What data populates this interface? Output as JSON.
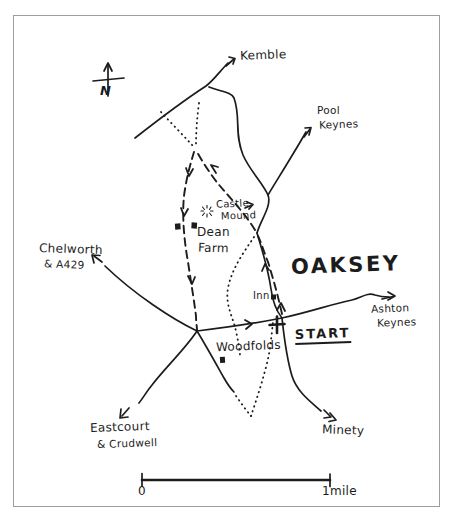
{
  "colors": {
    "ink": "#1c1c1c",
    "frame": "#9e9e9e",
    "paper": "#ffffff"
  },
  "compass": {
    "north_letter": "N"
  },
  "labels": {
    "kemble": "Kemble",
    "pool_keynes": {
      "line1": "Pool",
      "line2": "Keynes"
    },
    "castle_mound": {
      "line1": "Castle",
      "line2": "Mound"
    },
    "dean_farm": {
      "line1": "Dean",
      "line2": "Farm"
    },
    "chelworth": {
      "line1": "Chelworth",
      "line2": "& A429"
    },
    "oaksey": "OAKSEY",
    "inn": "Inn",
    "start": "START",
    "ashton_keynes": {
      "line1": "Ashton",
      "line2": "Keynes"
    },
    "woodfolds": "Woodfolds",
    "eastcourt": {
      "line1": "Eastcourt",
      "line2": "& Crudwell"
    },
    "minety": "Minety"
  },
  "scale_bar": {
    "start_label": "0",
    "end_label": "1mile"
  }
}
